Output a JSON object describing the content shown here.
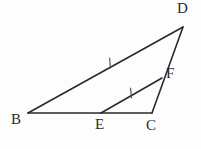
{
  "figure": {
    "kind": "geometry-diagram",
    "background_color": "#fdfdfd",
    "stroke_color": "#2a2a2a",
    "label_color": "#2b2b2b",
    "width": 201,
    "height": 149,
    "points": [
      {
        "name": "B",
        "label": "B",
        "x": 28,
        "y": 113,
        "label_x": 11,
        "label_y": 112
      },
      {
        "name": "E",
        "label": "E",
        "x": 101,
        "y": 113,
        "label_x": 95,
        "label_y": 117
      },
      {
        "name": "C",
        "label": "C",
        "x": 152,
        "y": 113,
        "label_x": 146,
        "label_y": 118
      },
      {
        "name": "D",
        "label": "D",
        "x": 183,
        "y": 27,
        "label_x": 177,
        "label_y": 1
      },
      {
        "name": "F",
        "label": "F",
        "x": 162,
        "y": 78,
        "label_x": 166,
        "label_y": 66
      }
    ],
    "segments": [
      {
        "name": "BD",
        "from": "B",
        "to": "D",
        "x1": 28,
        "y1": 113,
        "x2": 183,
        "y2": 27,
        "width": 1.6
      },
      {
        "name": "BC",
        "from": "B",
        "to": "C",
        "x1": 28,
        "y1": 113,
        "x2": 152,
        "y2": 113,
        "width": 1.6
      },
      {
        "name": "DC",
        "from": "D",
        "to": "C",
        "x1": 183,
        "y1": 27,
        "x2": 152,
        "y2": 113,
        "width": 1.6
      },
      {
        "name": "EF",
        "from": "E",
        "to": "F",
        "x1": 101,
        "y1": 113,
        "x2": 162,
        "y2": 78,
        "width": 1.6
      }
    ],
    "tick_marks": [
      {
        "name": "tick-on-BD",
        "on_segment": "BD",
        "x": 110,
        "y": 63,
        "angle_deg": -29,
        "count": 1
      },
      {
        "name": "tick-on-EF",
        "on_segment": "EF",
        "x": 131,
        "y": 93,
        "angle_deg": -30,
        "count": 1
      }
    ]
  }
}
